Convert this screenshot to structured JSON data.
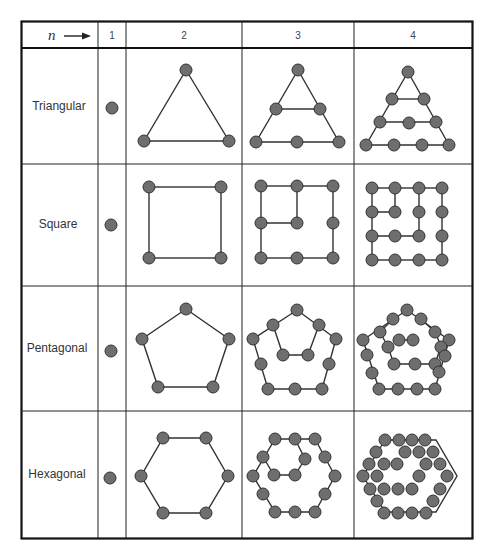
{
  "header": {
    "n_label": "n",
    "n_arrow_icon": "arrow-right-icon",
    "columns": [
      "1",
      "2",
      "3",
      "4"
    ]
  },
  "rows": [
    {
      "label": "Triangular"
    },
    {
      "label": "Square"
    },
    {
      "label": "Pentagonal"
    },
    {
      "label": "Hexagonal"
    }
  ],
  "style": {
    "dot_fill": "#6e6e6e",
    "dot_stroke": "#333333",
    "line_color": "#333333",
    "border_color": "#111111"
  },
  "figurate_numbers": {
    "Triangular": [
      1,
      3,
      6,
      10
    ],
    "Square": [
      1,
      4,
      9,
      16
    ],
    "Pentagonal": [
      1,
      5,
      12,
      22
    ],
    "Hexagonal": [
      1,
      6,
      15,
      28
    ]
  }
}
